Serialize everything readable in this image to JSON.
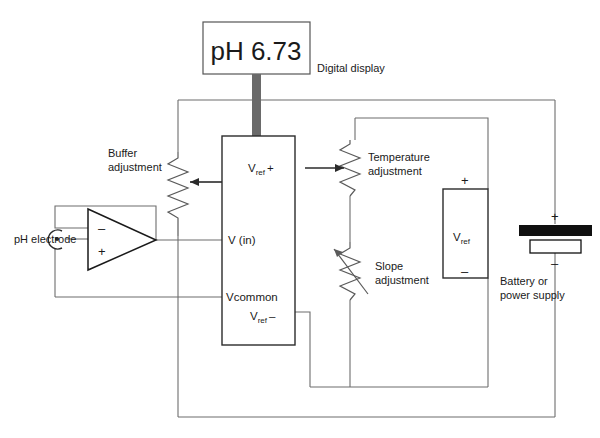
{
  "figure": {
    "background_color": "#ffffff",
    "wire_color": "#6d6d6d",
    "ink_color": "#1a1a1a"
  },
  "display": {
    "reading": "pH 6.73",
    "caption": "Digital display"
  },
  "meter_box": {
    "terminals": {
      "vref_plus": "V",
      "vref_plus_sub": "ref",
      "vref_plus_sign": "+",
      "v_in": "V (in)",
      "vcommon": "Vcommon",
      "vref_minus": "V",
      "vref_minus_sub": "ref",
      "vref_minus_sign": "–"
    }
  },
  "adjustments": [
    {
      "name": "buffer",
      "label_line1": "Buffer",
      "label_line2": "adjustment"
    },
    {
      "name": "temperature",
      "label_line1": "Temperature",
      "label_line2": "adjustment"
    },
    {
      "name": "slope",
      "label_line1": "Slope",
      "label_line2": "adjustment"
    }
  ],
  "electrode": {
    "label": "pH electrode"
  },
  "opamp": {
    "inverting_sign": "–",
    "noninverting_sign": "+"
  },
  "vref_source": {
    "plus": "+",
    "minus": "–",
    "label": "V",
    "label_sub": "ref"
  },
  "battery": {
    "plus": "+",
    "minus": "–",
    "label_line1": "Battery or",
    "label_line2": "power supply",
    "positive_color": "#101010",
    "negative_color": "#ffffff"
  }
}
